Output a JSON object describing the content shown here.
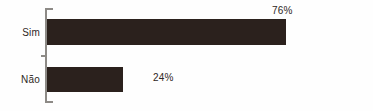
{
  "chart_data": {
    "type": "bar",
    "orientation": "horizontal",
    "title": "",
    "xlabel": "",
    "ylabel": "",
    "categories": [
      "Sim",
      "Não"
    ],
    "values": [
      76,
      24
    ],
    "value_labels": [
      "76%",
      "24%"
    ],
    "unit": "%",
    "xlim": [
      0,
      100
    ],
    "grid": false,
    "legend": false,
    "bar_color": "#2b211d",
    "axis_color": "#8d8a86",
    "text_color": "#2e2724",
    "background": "#ffffff",
    "series": [
      {
        "name": "",
        "values": [
          76,
          24
        ]
      }
    ],
    "points": [
      {
        "category": "Sim",
        "value": 76,
        "label": "76%"
      },
      {
        "category": "Não",
        "value": 24,
        "label": "24%"
      }
    ]
  }
}
